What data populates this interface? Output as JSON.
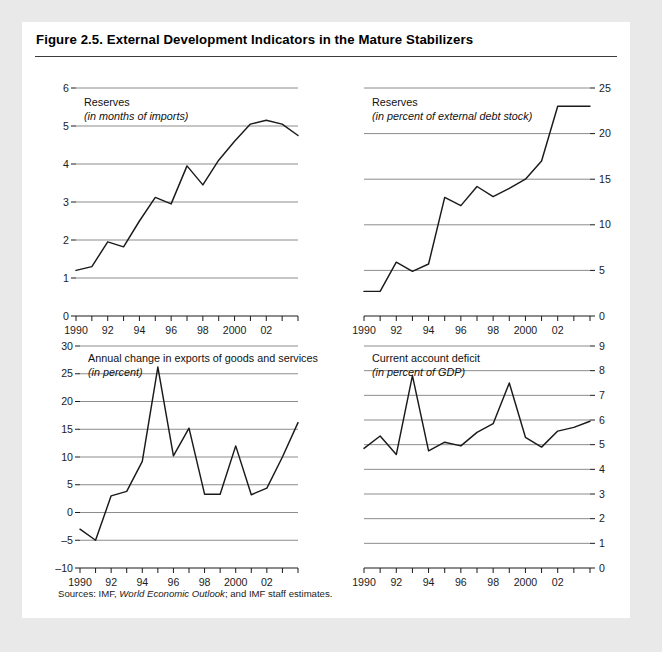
{
  "figure": {
    "title": "Figure 2.5.  External Development Indicators in the Mature Stabilizers",
    "sources_prefix": "Sources: IMF, ",
    "sources_italic": "World Economic Outlook",
    "sources_suffix": "; and IMF staff estimates."
  },
  "colors": {
    "page_background": "#e9e9e9",
    "panel_background": "#ffffff",
    "line": "#1a1a1a",
    "gridline": "#8c8c8c",
    "axis": "#1a1a1a",
    "text": "#111111"
  },
  "chart_data": [
    {
      "id": "reserves-months-imports",
      "type": "line",
      "title": "Reserves",
      "subtitle": "(in months of imports)",
      "xlabel": "",
      "ylabel": "",
      "grid": true,
      "legend": "none",
      "x": [
        1990,
        1991,
        1992,
        1993,
        1994,
        1995,
        1996,
        1997,
        1998,
        1999,
        2000,
        2001,
        2002,
        2003,
        2004
      ],
      "xtick_labels": [
        "1990",
        "",
        "92",
        "",
        "94",
        "",
        "96",
        "",
        "98",
        "",
        "2000",
        "",
        "02",
        "",
        ""
      ],
      "ylim": [
        0,
        6
      ],
      "yticks": [
        0,
        1,
        2,
        3,
        4,
        5,
        6
      ],
      "ytick_labels": [
        "0",
        "1",
        "2",
        "3",
        "4",
        "5",
        "6"
      ],
      "gridlines": [
        1,
        2,
        3,
        4,
        5,
        6
      ],
      "values": [
        1.2,
        1.3,
        1.95,
        1.82,
        2.5,
        3.12,
        2.95,
        3.95,
        3.45,
        4.1,
        4.6,
        5.05,
        5.15,
        5.05,
        4.75
      ]
    },
    {
      "id": "reserves-percent-external-debt",
      "type": "line",
      "title": "Reserves",
      "subtitle": "(in percent of external debt stock)",
      "xlabel": "",
      "ylabel": "",
      "grid": true,
      "legend": "none",
      "x": [
        1990,
        1991,
        1992,
        1993,
        1994,
        1995,
        1996,
        1997,
        1998,
        1999,
        2000,
        2001,
        2002,
        2003,
        2004
      ],
      "xtick_labels": [
        "1990",
        "",
        "92",
        "",
        "94",
        "",
        "96",
        "",
        "98",
        "",
        "2000",
        "",
        "02",
        "",
        ""
      ],
      "ylim": [
        0,
        25
      ],
      "yticks": [
        0,
        5,
        10,
        15,
        20,
        25
      ],
      "ytick_labels": [
        "0",
        "5",
        "10",
        "15",
        "20",
        "25"
      ],
      "gridlines": [
        5,
        10,
        15,
        20,
        25
      ],
      "values": [
        2.7,
        2.7,
        5.9,
        4.9,
        5.7,
        13.0,
        12.1,
        14.2,
        13.1,
        14.0,
        15.0,
        17.0,
        23.0,
        23.0,
        23.0
      ]
    },
    {
      "id": "annual-change-exports",
      "type": "line",
      "title": "Annual change in exports of goods and services",
      "subtitle": "(in percent)",
      "xlabel": "",
      "ylabel": "",
      "grid": true,
      "legend": "none",
      "x": [
        1990,
        1991,
        1992,
        1993,
        1994,
        1995,
        1996,
        1997,
        1998,
        1999,
        2000,
        2001,
        2002,
        2003,
        2004
      ],
      "xtick_labels": [
        "1990",
        "",
        "92",
        "",
        "94",
        "",
        "96",
        "",
        "98",
        "",
        "2000",
        "",
        "02",
        "",
        ""
      ],
      "ylim": [
        -10,
        30
      ],
      "yticks": [
        -10,
        -5,
        0,
        5,
        10,
        15,
        20,
        25,
        30
      ],
      "ytick_labels": [
        "–10",
        "–5",
        "0",
        "5",
        "10",
        "15",
        "20",
        "25",
        "30"
      ],
      "gridlines": [
        -5,
        0,
        5,
        10,
        15,
        20,
        25,
        30
      ],
      "values": [
        -3.0,
        -5.0,
        3.0,
        3.8,
        9.2,
        26.2,
        10.2,
        15.2,
        3.3,
        3.3,
        12.0,
        3.2,
        4.4,
        10.0,
        16.2
      ]
    },
    {
      "id": "current-account-deficit",
      "type": "line",
      "title": "Current account deficit",
      "subtitle": "(in percent of GDP)",
      "xlabel": "",
      "ylabel": "",
      "grid": true,
      "legend": "none",
      "x": [
        1990,
        1991,
        1992,
        1993,
        1994,
        1995,
        1996,
        1997,
        1998,
        1999,
        2000,
        2001,
        2002,
        2003,
        2004
      ],
      "xtick_labels": [
        "1990",
        "",
        "92",
        "",
        "94",
        "",
        "96",
        "",
        "98",
        "",
        "2000",
        "",
        "02",
        "",
        ""
      ],
      "ylim": [
        0,
        9
      ],
      "yticks": [
        0,
        1,
        2,
        3,
        4,
        5,
        6,
        7,
        8,
        9
      ],
      "ytick_labels": [
        "0",
        "1",
        "2",
        "3",
        "4",
        "5",
        "6",
        "7",
        "8",
        "9"
      ],
      "gridlines": [
        1,
        2,
        3,
        4,
        5,
        6,
        7,
        8,
        9
      ],
      "values": [
        4.85,
        5.35,
        4.6,
        7.8,
        4.75,
        5.1,
        4.95,
        5.5,
        5.85,
        7.5,
        5.3,
        4.9,
        5.55,
        5.7,
        5.95
      ]
    }
  ]
}
